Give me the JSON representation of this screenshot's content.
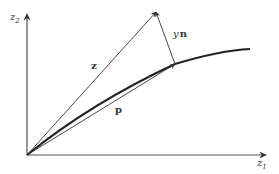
{
  "diagram": {
    "axes": {
      "horizontal": {
        "label": "z",
        "subscript": "1"
      },
      "vertical": {
        "label": "z",
        "subscript": "2"
      }
    },
    "vectors": {
      "z": {
        "label": "z"
      },
      "p": {
        "label": "p"
      },
      "yn": {
        "label_scalar": "y",
        "label_vector": "n"
      }
    },
    "colors": {
      "stroke": "#333333",
      "axis": "#555555",
      "background": "#ffffff"
    }
  }
}
